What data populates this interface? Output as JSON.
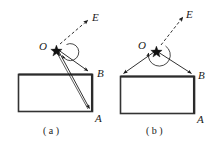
{
  "figure": {
    "background_color": "#ffffff",
    "stroke_color": "#1a1a1a",
    "panels": [
      {
        "id": "a",
        "caption": "( a )",
        "vertex_label": "O",
        "force_label": "E",
        "corner_labels": {
          "upper": "B",
          "lower": "A"
        },
        "description": "Rectangular block hung by two ropes from point O; the ropes attach to corner B and corner A on the right side of the rectangle. A dashed arrow from O points up-right toward E. An arc marks the angle between the two ropes at O.",
        "geometry": {
          "rect": {
            "x": 18,
            "y": 74,
            "width": 75,
            "height": 38
          },
          "point_O": {
            "x": 55,
            "y": 48
          },
          "rope_endpoints": [
            {
              "label": "B",
              "x": 91,
              "y": 73
            },
            {
              "label": "A",
              "x": 92,
              "y": 111
            }
          ],
          "force_arrow": {
            "from_x": 59,
            "from_y": 45,
            "to_x": 89,
            "to_y": 20,
            "style": "dashed"
          },
          "angle_arc": {
            "center_x": 58,
            "center_y": 47,
            "radius": 8
          }
        }
      },
      {
        "id": "b",
        "caption": "( b )",
        "vertex_label": "O",
        "force_label": "E",
        "corner_labels": {
          "upper": "B",
          "lower": "A"
        },
        "description": "Rectangular block hung by two ropes from point O; the ropes attach to the top-left corner and the top-right corner B of the rectangle. A dashed arrow from O points up-right toward E. A large arc marks the wide angle between the two ropes at O.",
        "geometry": {
          "rect": {
            "x": 120,
            "y": 76,
            "width": 75,
            "height": 38
          },
          "point_O": {
            "x": 156,
            "y": 50
          },
          "rope_endpoints": [
            {
              "label": "",
              "x": 121,
              "y": 75
            },
            {
              "label": "B",
              "x": 194,
              "y": 75
            }
          ],
          "force_arrow": {
            "from_x": 160,
            "from_y": 46,
            "to_x": 184,
            "to_y": 17,
            "style": "dashed"
          },
          "angle_arc": {
            "center_x": 156,
            "center_y": 49,
            "radius": 10
          }
        }
      }
    ]
  },
  "labels": {
    "panel_a": {
      "O": "O",
      "E": "E",
      "B": "B",
      "A": "A",
      "caption": "( a )"
    },
    "panel_b": {
      "O": "O",
      "E": "E",
      "B": "B",
      "A": "A",
      "caption": "( b )"
    }
  }
}
